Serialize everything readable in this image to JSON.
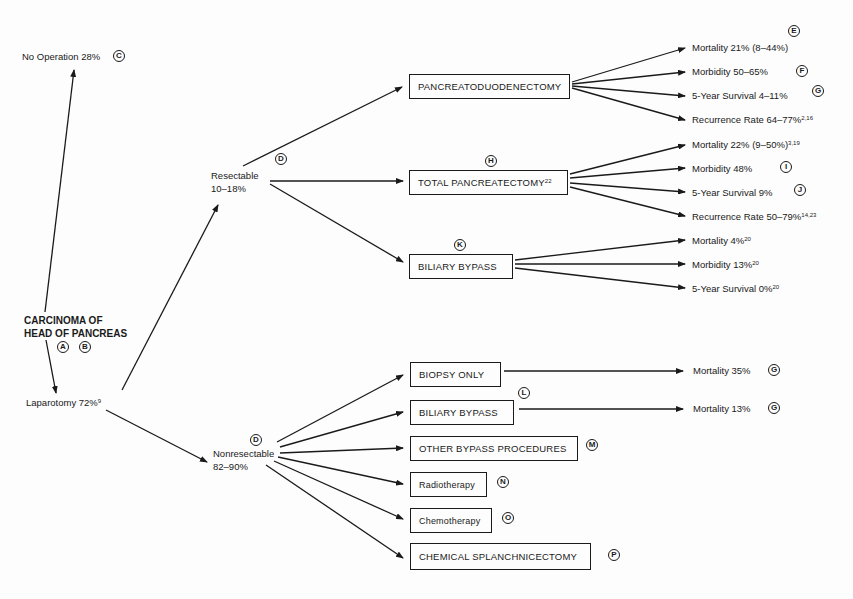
{
  "root": {
    "line1": "CARCINOMA OF",
    "line2": "HEAD OF PANCREAS",
    "markers": [
      "A",
      "B"
    ]
  },
  "no_operation": {
    "label": "No Operation 28%",
    "marker": "C"
  },
  "laparotomy": {
    "label": "Laparotomy 72%",
    "ref": "9"
  },
  "resectable": {
    "line1": "Resectable",
    "line2": "10–18%",
    "marker": "D"
  },
  "nonresectable": {
    "line1": "Nonresectable",
    "line2": "82–90%",
    "marker": "D"
  },
  "resectable_options": [
    {
      "label": "PANCREATODUODENECTOMY",
      "ref": "",
      "marker": "",
      "outcomes": [
        {
          "text": "Mortality 21% (8–44%)",
          "ref": "",
          "marker": "E"
        },
        {
          "text": "Morbidity 50–65%",
          "ref": "",
          "marker": "F"
        },
        {
          "text": "5-Year Survival 4–11%",
          "ref": "",
          "marker": "G"
        },
        {
          "text": "Recurrence Rate 64–77%",
          "ref": "2,16",
          "marker": ""
        }
      ]
    },
    {
      "label": "TOTAL PANCREATECTOMY",
      "ref": "22",
      "marker": "H",
      "outcomes": [
        {
          "text": "Mortality 22% (9–50%)",
          "ref": "3,19",
          "marker": ""
        },
        {
          "text": "Morbidity 48%",
          "ref": "",
          "marker": "I"
        },
        {
          "text": "5-Year Survival 9%",
          "ref": "",
          "marker": "J"
        },
        {
          "text": "Recurrence Rate 50–79%",
          "ref": "14,23",
          "marker": ""
        }
      ]
    },
    {
      "label": "BILIARY BYPASS",
      "ref": "",
      "marker": "K",
      "outcomes": [
        {
          "text": "Mortality 4%",
          "ref": "20",
          "marker": ""
        },
        {
          "text": "Morbidity 13%",
          "ref": "20",
          "marker": ""
        },
        {
          "text": "5-Year Survival 0%",
          "ref": "20",
          "marker": ""
        }
      ]
    }
  ],
  "nonresectable_options": [
    {
      "label": "BIOPSY ONLY",
      "marker": "",
      "outcome": {
        "text": "Mortality 35%",
        "marker": "G"
      }
    },
    {
      "label": "BILIARY BYPASS",
      "marker": "L",
      "outcome": {
        "text": "Mortality 13%",
        "marker": "G"
      }
    },
    {
      "label": "OTHER BYPASS PROCEDURES",
      "marker": "M"
    },
    {
      "label": "Radiotherapy",
      "marker": "N"
    },
    {
      "label": "Chemotherapy",
      "marker": "O"
    },
    {
      "label": "CHEMICAL SPLANCHNICECTOMY",
      "marker": "P"
    }
  ]
}
